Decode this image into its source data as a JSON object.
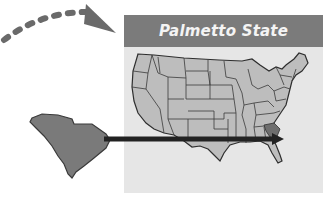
{
  "card": {
    "title": "Palmetto State"
  },
  "colors": {
    "header_bg": "#7b7b7b",
    "header_text": "#f4f4f4",
    "card_bg": "#e6e6e6",
    "state_fill": "#bdbdbd",
    "highlight_fill": "#6e6e6e",
    "outline": "#2e2e2e",
    "arrow": "#222222",
    "dashed_arrow": "#6a6a6a"
  },
  "icons": {
    "us_map": "us-states-map",
    "sc_shape": "south-carolina-silhouette",
    "pointer_arrow": "right-arrow",
    "curved_arrow": "dashed-curved-arrow"
  }
}
